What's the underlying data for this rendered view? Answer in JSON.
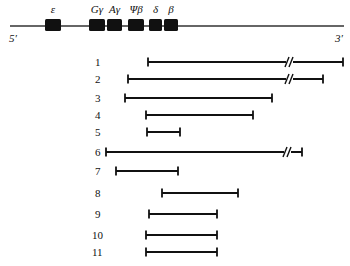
{
  "chromosome": {
    "line": {
      "x1": 10,
      "x2": 344,
      "y": 26
    },
    "five_prime_label": "5′",
    "three_prime_label": "3′",
    "genes": [
      {
        "name": "ε",
        "x": 45,
        "w": 16
      },
      {
        "name": "Gγ",
        "x": 89,
        "w": 16
      },
      {
        "name": "Aγ",
        "x": 107,
        "w": 15
      },
      {
        "name": "Ψβ",
        "x": 128,
        "w": 16
      },
      {
        "name": "δ",
        "x": 149,
        "w": 13
      },
      {
        "name": "β",
        "x": 164,
        "w": 14
      }
    ]
  },
  "fragments": [
    {
      "label": "1",
      "x1": 148,
      "x2": 343,
      "y": 62,
      "break_at": 289
    },
    {
      "label": "2",
      "x1": 128,
      "x2": 323,
      "y": 79,
      "break_at": 289
    },
    {
      "label": "3",
      "x1": 125,
      "x2": 272,
      "y": 98,
      "break_at": null
    },
    {
      "label": "4",
      "x1": 146,
      "x2": 253,
      "y": 115,
      "break_at": null
    },
    {
      "label": "5",
      "x1": 147,
      "x2": 180,
      "y": 132,
      "break_at": null
    },
    {
      "label": "6",
      "x1": 106,
      "x2": 302,
      "y": 152,
      "break_at": 287
    },
    {
      "label": "7",
      "x1": 116,
      "x2": 178,
      "y": 171,
      "break_at": null
    },
    {
      "label": "8",
      "x1": 162,
      "x2": 238,
      "y": 193,
      "break_at": null
    },
    {
      "label": "9",
      "x1": 149,
      "x2": 217,
      "y": 214,
      "break_at": null
    },
    {
      "label": "10",
      "x1": 146,
      "x2": 217,
      "y": 235,
      "break_at": null
    },
    {
      "label": "11",
      "x1": 146,
      "x2": 217,
      "y": 252,
      "break_at": null
    }
  ],
  "colors": {
    "ink": "#111111",
    "background": "#ffffff"
  }
}
